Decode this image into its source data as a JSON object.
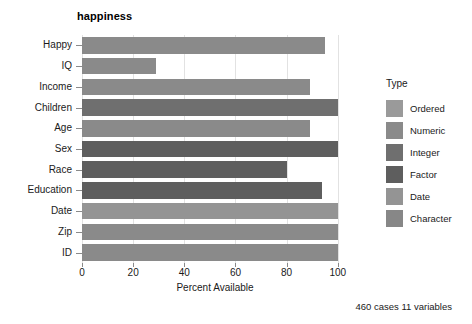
{
  "chart_data": {
    "type": "bar",
    "orientation": "horizontal",
    "title": "happiness",
    "xlabel": "Percent Available",
    "ylabel": "",
    "caption": "460 cases 11 variables",
    "xlim": [
      0,
      104
    ],
    "xticks": [
      0,
      20,
      40,
      60,
      80,
      100
    ],
    "xtick_labels": [
      "0",
      "20",
      "40",
      "60",
      "80",
      "100"
    ],
    "grid": true,
    "grid_axis": "x",
    "legend_position": "right",
    "legend_title": "Type",
    "categories": [
      "Happy",
      "IQ",
      "Income",
      "Children",
      "Age",
      "Sex",
      "Race",
      "Education",
      "Date",
      "Zip",
      "ID"
    ],
    "values": [
      95,
      29,
      89,
      100,
      89,
      100,
      80,
      94,
      100,
      100,
      100
    ],
    "bar_types": [
      "Numeric",
      "Numeric",
      "Numeric",
      "Integer",
      "Numeric",
      "Factor",
      "Factor",
      "Factor",
      "Date",
      "Numeric",
      "Numeric"
    ],
    "bar_colors": [
      "#8a8a8a",
      "#8a8a8a",
      "#8a8a8a",
      "#6f6f6f",
      "#8a8a8a",
      "#5e5e5e",
      "#5e5e5e",
      "#5e5e5e",
      "#949494",
      "#8a8a8a",
      "#8a8a8a"
    ],
    "series": [
      {
        "name": "Percent Available",
        "values": [
          95,
          29,
          89,
          100,
          89,
          100,
          80,
          94,
          100,
          100,
          100
        ]
      }
    ],
    "legend": [
      {
        "label": "Ordered",
        "color": "#9a9a9a"
      },
      {
        "label": "Numeric",
        "color": "#8a8a8a"
      },
      {
        "label": "Integer",
        "color": "#6f6f6f"
      },
      {
        "label": "Factor",
        "color": "#5e5e5e"
      },
      {
        "label": "Date",
        "color": "#949494"
      },
      {
        "label": "Character",
        "color": "#878787"
      }
    ],
    "colors": {
      "panel_background": "#ffffff",
      "gridline": "#e2e2e2",
      "axis_text": "#1a1a1a",
      "figure_background": "#ffffff"
    }
  }
}
